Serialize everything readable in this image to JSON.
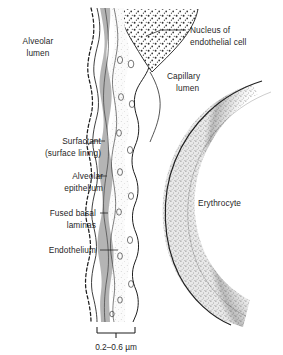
{
  "figure": {
    "scale_bar": {
      "label": "0.2–0.6 µm"
    },
    "labels": {
      "alveolar_lumen_line1": "Alveolar",
      "alveolar_lumen_line2": "lumen",
      "nucleus_line1": "Nucleus of",
      "nucleus_line2": "endothelial cell",
      "capillary_lumen_line1": "Capillary",
      "capillary_lumen_line2": "lumen",
      "surfactant_line1": "Surfactant",
      "surfactant_line2": "(surface lining)",
      "alveolar_epithelium_line1": "Alveolar",
      "alveolar_epithelium_line2": "epithelium",
      "fused_basal_line1": "Fused basal",
      "fused_basal_line2": "laminas",
      "endothelium": "Endothelium",
      "erythrocyte": "Erythrocyte"
    },
    "colors": {
      "ink": "#1f1f1f",
      "background": "#ffffff",
      "basal_lamina_fill": "#b4b4b4",
      "cytoplasm_fill": "#f2f2f2",
      "stipple": "#3a3a3a"
    }
  }
}
